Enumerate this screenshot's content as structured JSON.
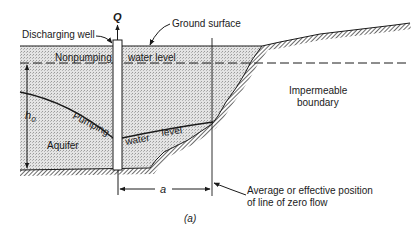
{
  "figure": {
    "caption": "(a)",
    "labels": {
      "discharge": "Q",
      "discharging_well": "Discharging well",
      "ground_surface": "Ground surface",
      "nonpumping": "Nonpumping",
      "water_level_1": "water level",
      "pumping": "Pumping",
      "water_2": "water",
      "level_2": "level",
      "aquifer": "Aquifer",
      "h0": "h",
      "h0_sub": "0",
      "impermeable_1": "Impermeable",
      "impermeable_2": "boundary",
      "distance": "a",
      "zero_flow_1": "Average or effective position",
      "zero_flow_2": "of line of zero flow"
    },
    "colors": {
      "line": "#1a1a1a",
      "aquifer_fill": "#d9d9d9",
      "hatch": "#555555"
    }
  }
}
